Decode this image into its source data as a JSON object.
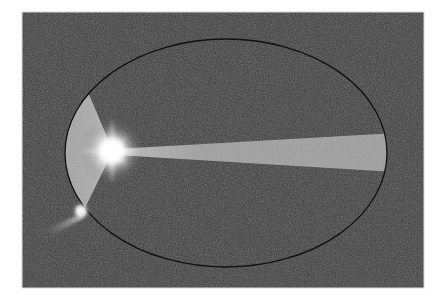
{
  "figure": {
    "canvas": {
      "width": 446,
      "height": 305,
      "background_color": "#ffffff"
    },
    "panel": {
      "name": "image-panel",
      "x": 22,
      "y": 12,
      "width": 402,
      "height": 276,
      "fill_color": "#3c3c3c",
      "noise": "fine-grain-speckle",
      "border_color": "#d8d8d8"
    },
    "ellipse": {
      "label": "orbit-outline",
      "center_x": 226,
      "center_y": 153,
      "semi_major_x": 162,
      "semi_minor_y": 115,
      "stroke_color": "#101010",
      "stroke_width": 1.3,
      "fill": "none"
    },
    "central_source": {
      "label": "bright-core",
      "x": 112,
      "y": 151,
      "core_radius": 9,
      "glow_radius": 34,
      "color": "#ffffff",
      "spike_count": 8,
      "spike_length": 30
    },
    "left_wedge": {
      "label": "left-fan-lobe",
      "apex_x": 112,
      "apex_y": 151,
      "upper_vertex_x": 88,
      "upper_vertex_y": 93,
      "lower_vertex_x": 86,
      "lower_vertex_y": 208,
      "fill_color": "#a9a9a9",
      "clipped_by": "ellipse"
    },
    "right_beam": {
      "label": "right-jet-beam",
      "origin_x": 118,
      "origin_y": 152,
      "end_x": 388,
      "top_end_y": 136,
      "bottom_end_y": 170,
      "fill_color": "#9c9c9c",
      "clipped_by": "ellipse"
    },
    "companion": {
      "label": "companion-knot",
      "x": 81,
      "y": 211,
      "size": 8,
      "color": "#f4f4f4",
      "tail_angle_deg": 208,
      "tail_length": 42,
      "tail_color": "#b4b4b4"
    }
  },
  "chart_data": {
    "type": "scatter",
    "title": "",
    "xlabel": "",
    "ylabel": "",
    "elements": [
      {
        "name": "ellipse-outline",
        "cx": 226,
        "cy": 153,
        "rx": 162,
        "ry": 115
      },
      {
        "name": "bright-core",
        "x": 112,
        "y": 151,
        "brightness": 1.0
      },
      {
        "name": "companion-knot",
        "x": 81,
        "y": 211,
        "brightness": 0.88
      },
      {
        "name": "left-fan-lobe",
        "apex": [
          112,
          151
        ],
        "span_deg": 96,
        "brightness": 0.66
      },
      {
        "name": "right-jet-beam",
        "from": [
          118,
          152
        ],
        "to": [
          388,
          153
        ],
        "brightness": 0.61
      }
    ]
  }
}
